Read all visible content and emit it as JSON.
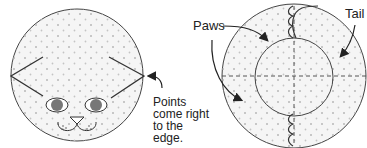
{
  "figure": {
    "left": {
      "name": "cat-face-circle",
      "annotation": [
        "Points",
        "come right",
        "to the",
        "edge."
      ]
    },
    "right": {
      "name": "cat-body-circle",
      "labels": {
        "paws": "Paws",
        "tail": "Tail"
      }
    },
    "colors": {
      "stroke": "#333333",
      "fill": "#f4f4f4",
      "dots": "#b8b8b8"
    }
  }
}
